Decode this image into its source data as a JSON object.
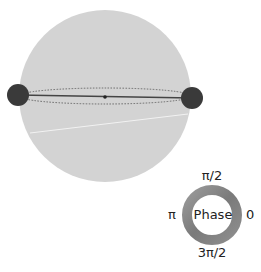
{
  "sphere": {
    "fill": "#d3d3d3",
    "atom_color": "#3a3a3a",
    "line_color": "#444444"
  },
  "phase_legend": {
    "title": "Phase",
    "top": "π/2",
    "left": "π",
    "right": "0",
    "bottom": "3π/2"
  }
}
